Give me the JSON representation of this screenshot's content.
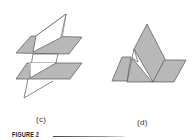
{
  "figure": {
    "caption": "FIGURE 2",
    "panels": [
      {
        "id": "c",
        "label": "(c)",
        "description": "Two parallel planes cut by a third plane"
      },
      {
        "id": "d",
        "label": "(d)",
        "description": "Intersecting planes forming a peak"
      }
    ]
  },
  "colors": {
    "plane_fill": "#b8b8b8",
    "edge": "#555555",
    "background": "#ffffff"
  }
}
